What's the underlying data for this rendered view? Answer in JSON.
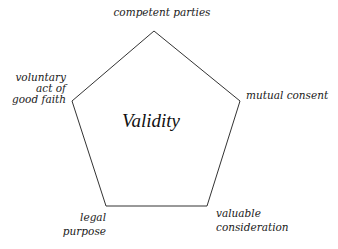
{
  "diagram": {
    "type": "pentagon",
    "center_label": "Validity",
    "stroke_color": "#333333",
    "background": "#ffffff",
    "vertices": [
      {
        "id": "top",
        "x": 154,
        "y": 31,
        "label_lines": [
          "competent parties"
        ]
      },
      {
        "id": "upper-right",
        "x": 240,
        "y": 101,
        "label_lines": [
          "mutual consent"
        ]
      },
      {
        "id": "lower-right",
        "x": 207,
        "y": 206,
        "label_lines": [
          "valuable",
          "consideration"
        ]
      },
      {
        "id": "lower-left",
        "x": 106,
        "y": 206,
        "label_lines": [
          "legal",
          "purpose"
        ]
      },
      {
        "id": "upper-left",
        "x": 72,
        "y": 101,
        "label_lines": [
          "voluntary",
          "act of",
          "good faith"
        ]
      }
    ]
  }
}
